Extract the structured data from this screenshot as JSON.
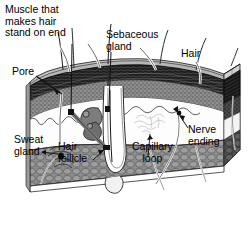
{
  "diagram": {
    "type": "anatomical-cross-section",
    "style": "grayscale line drawing, 3D block perspective",
    "palette": {
      "background": "#ffffff",
      "epidermis_surface": "#b9b9b9",
      "striated_band": "#2b2b2b",
      "granular_layer": "#8f8f8f",
      "dermis_void": "#fdfdfd",
      "fat_cobblestone": "#8a8a8a",
      "side_face_dark": "#3a3a3a",
      "ink": "#000000"
    },
    "labels": [
      {
        "id": "muscle",
        "name": "Muscle that makes hair stand on end",
        "lines": [
          "Muscle that",
          "makes hair",
          "stand on end"
        ],
        "x": 5,
        "y": 4,
        "align": "left"
      },
      {
        "id": "sebaceous",
        "name": "Sebaceous gland",
        "lines": [
          "Sebaceous",
          "gland"
        ],
        "x": 106,
        "y": 29,
        "align": "left"
      },
      {
        "id": "hair",
        "name": "Hair",
        "lines": [
          "Hair"
        ],
        "x": 181,
        "y": 48,
        "align": "left"
      },
      {
        "id": "pore",
        "name": "Pore",
        "lines": [
          "Pore"
        ],
        "x": 12,
        "y": 66,
        "align": "left"
      },
      {
        "id": "sweat",
        "name": "Sweat gland",
        "lines": [
          "Sweat",
          "gland"
        ],
        "x": 14,
        "y": 134,
        "align": "left"
      },
      {
        "id": "follicle",
        "name": "Hair follicle",
        "lines": [
          "Hair",
          "follicle"
        ],
        "x": 58,
        "y": 141,
        "align": "left"
      },
      {
        "id": "capillary",
        "name": "Capillary loop",
        "lines": [
          "Capillary",
          "loop"
        ],
        "x": 132,
        "y": 141,
        "align": "left"
      },
      {
        "id": "nerve",
        "name": "Nerve ending",
        "lines": [
          "Nerve",
          "ending"
        ],
        "x": 188,
        "y": 124,
        "align": "left"
      }
    ],
    "structures": [
      "epidermis",
      "dermis",
      "subcutaneous fat",
      "hair shaft",
      "hair follicle",
      "hair bulb",
      "sebaceous gland",
      "arrector pili muscle",
      "sweat gland",
      "sweat duct",
      "pore",
      "capillary loop",
      "nerve ending"
    ]
  }
}
